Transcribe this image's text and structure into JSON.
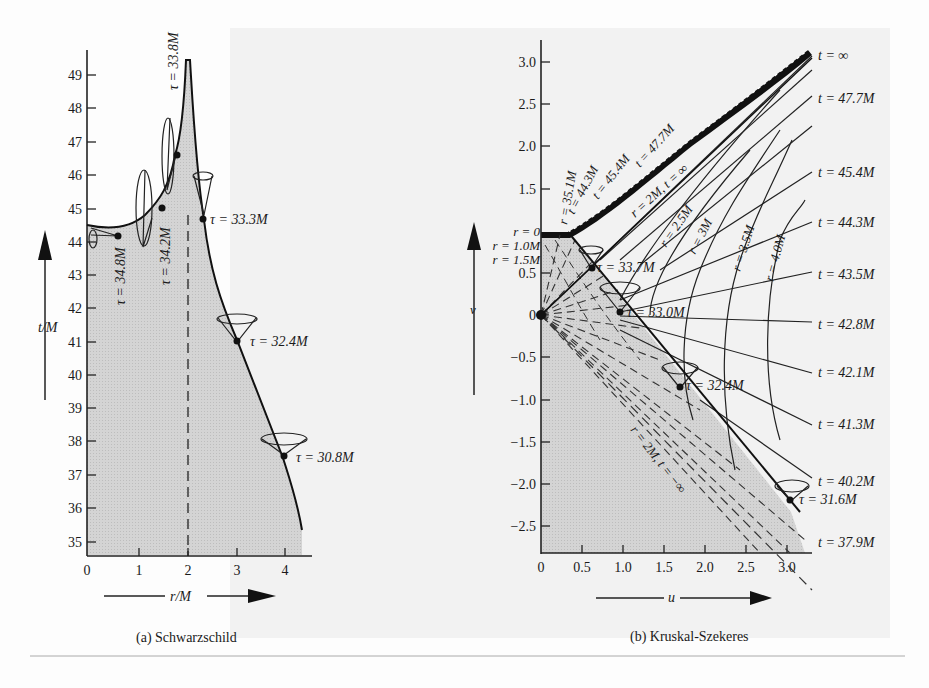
{
  "figure": {
    "panel_a": {
      "caption": "(a) Schwarzschild",
      "x_axis_label": "r/M",
      "y_axis_label": "t/M",
      "x_ticks": [
        "0",
        "1",
        "2",
        "3",
        "4"
      ],
      "y_ticks": [
        "35",
        "36",
        "37",
        "38",
        "39",
        "40",
        "41",
        "42",
        "43",
        "44",
        "45",
        "46",
        "47",
        "48",
        "49"
      ],
      "horizon_marker": "r = 2M (dashed)",
      "tau_labels": [
        "τ = 34.8M",
        "τ = 34.2M",
        "τ = 33.8M",
        "τ = 33.3M",
        "τ = 32.4M",
        "τ = 30.8M"
      ]
    },
    "panel_b": {
      "caption": "(b) Kruskal-Szekeres",
      "x_axis_label": "u",
      "y_axis_label": "v",
      "x_ticks": [
        "0",
        "0.5",
        "1.0",
        "1.5",
        "2.0",
        "2.5",
        "3.0"
      ],
      "y_ticks": [
        "3.0",
        "2.5",
        "2.0",
        "1.5",
        "1.0",
        "0.5",
        "0",
        "−0.5",
        "−1.0",
        "−1.5",
        "−2.0",
        "−2.5"
      ],
      "r_labels_left": [
        "r = 0",
        "r = 1.0M",
        "r = 1.5M"
      ],
      "diag_labels": [
        "r = 35.1M",
        "t = 44.3M",
        "t = 45.4M",
        "t = 47.7M",
        "r = 2M, t = ∞",
        "r = 2.5M",
        "r = 3M",
        "r = 3.5M",
        "r = 4.0M"
      ],
      "horizon_lower_label": "r = 2M, t = −∞",
      "tau_labels": [
        "τ = 33.7M",
        "τ = 33.0M",
        "τ = 32.4M",
        "τ = 31.6M"
      ],
      "t_labels_right": [
        "t = ∞",
        "t = 47.7M",
        "t = 45.4M",
        "t = 44.3M",
        "t = 43.5M",
        "t = 42.8M",
        "t = 42.1M",
        "t = 41.3M",
        "t = 40.2M",
        "t = 37.9M"
      ]
    }
  }
}
